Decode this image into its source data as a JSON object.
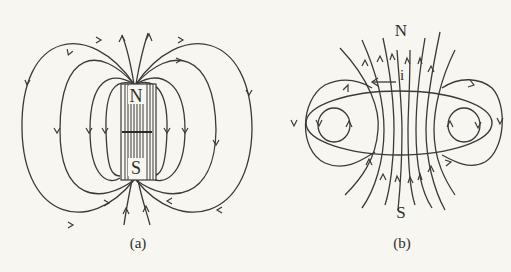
{
  "figure": {
    "panels": [
      {
        "id": "a",
        "caption": "(a)",
        "description": "Magnetic field lines of a bar magnet",
        "magnet": {
          "north_label": "N",
          "south_label": "S"
        }
      },
      {
        "id": "b",
        "caption": "(b)",
        "description": "Magnetic field lines of a current loop",
        "north_label": "N",
        "south_label": "S",
        "current_label": "i"
      }
    ],
    "colors": {
      "background": "#f7f6f0",
      "ink": "#3a3a3a"
    }
  }
}
